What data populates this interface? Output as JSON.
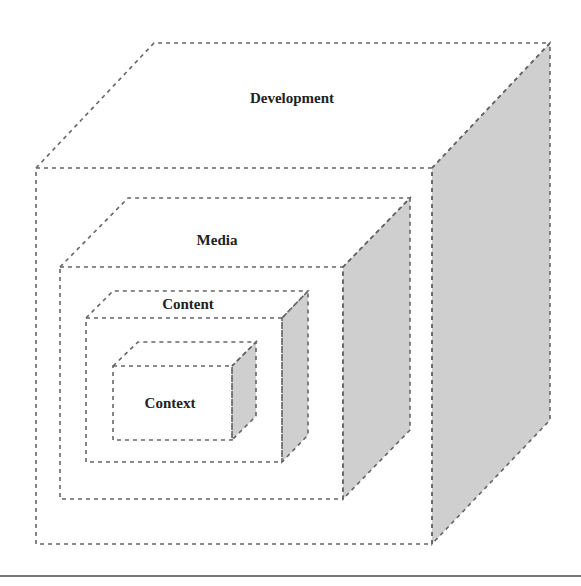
{
  "diagram": {
    "title": "",
    "boxes": [
      {
        "label": "Development",
        "front": [
          36,
          168,
          432,
          544
        ],
        "depth": [
          118,
          -125
        ]
      },
      {
        "label": "Media",
        "front": [
          60,
          267,
          343,
          499
        ],
        "depth": [
          68,
          -69
        ]
      },
      {
        "label": "Content",
        "front": [
          86,
          318,
          282,
          462
        ],
        "depth": [
          26,
          -27
        ]
      },
      {
        "label": "Context",
        "front": [
          113,
          366,
          232,
          440
        ],
        "depth": [
          24,
          -24
        ]
      }
    ],
    "colors": {
      "side_fill": "#cfcfcf",
      "edge": "#666666",
      "text": "#222222"
    }
  }
}
